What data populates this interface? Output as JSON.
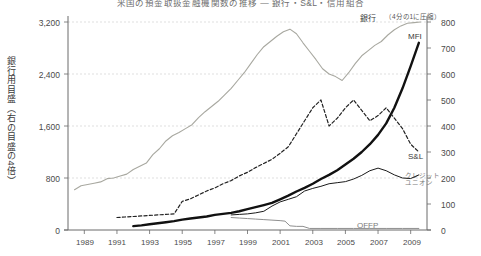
{
  "title": "米国の預金取扱金融機関数の推移 ― 銀行・S&L・信用組合",
  "axes": {
    "left": {
      "label": "銀行用目盛（右の目盛の4倍）",
      "ticks": [
        "3,200",
        "2,400",
        "1,600",
        "800",
        "0"
      ],
      "tick_values": [
        3200,
        2400,
        1600,
        800,
        0
      ],
      "min": 0,
      "max": 3200
    },
    "right": {
      "label": "",
      "ticks": [
        "800",
        "700",
        "600",
        "500",
        "400",
        "300",
        "200",
        "100",
        "0"
      ],
      "tick_values": [
        800,
        700,
        600,
        500,
        400,
        300,
        200,
        100,
        0
      ],
      "min": 0,
      "max": 800
    },
    "x": {
      "ticks": [
        "1989",
        "1991",
        "1993",
        "1995",
        "1997",
        "1999",
        "2001",
        "2003",
        "2005",
        "2007",
        "2009"
      ],
      "min": 1988,
      "max": 2010
    }
  },
  "annotations": {
    "bank": "銀行",
    "bank_note": "（4分の1に圧縮）",
    "mfi": "MFI",
    "snl": "S&L",
    "credit_union_l1": "クレジット",
    "credit_union_l2": "ユニオン",
    "offp": "OFFP"
  },
  "colors": {
    "bank": "#a8a8a0",
    "mfi": "#111111",
    "snl": "#222222",
    "credit_union": "#1a1a1a",
    "offp": "#8f8f8f",
    "grid": "#c9c9c9",
    "axis": "#6a6a6a"
  },
  "chart_data": {
    "type": "line",
    "title": "米国の預金取扱金融機関数の推移 ― 銀行・S&L・信用組合",
    "xlabel": "",
    "ylabel": "銀行用目盛（右の目盛の4倍）",
    "y2label": "",
    "xlim": [
      1988,
      2010
    ],
    "ylim": [
      0,
      3200
    ],
    "y2lim": [
      0,
      800
    ],
    "grid": true,
    "legend": "inline-annotations",
    "note": "銀行系列は左目盛（右目盛の4倍）。その他の系列は右目盛（0-800）。",
    "series": [
      {
        "name": "銀行",
        "axis": "left",
        "style": "solid-gray",
        "color": "#a8a8a0",
        "x": [
          1988.4,
          1988.8,
          1989.2,
          1989.6,
          1990.0,
          1990.4,
          1990.8,
          1991.2,
          1991.6,
          1992.0,
          1992.4,
          1992.8,
          1993.2,
          1993.6,
          1994.0,
          1994.4,
          1994.8,
          1995.2,
          1995.6,
          1996.0,
          1996.4,
          1996.8,
          1997.2,
          1997.6,
          1998.0,
          1998.4,
          1998.8,
          1999.2,
          1999.6,
          2000.0,
          2000.4,
          2000.8,
          2001.2,
          2001.6,
          2002.0,
          2002.4,
          2002.8,
          2003.2,
          2003.6,
          2004.0,
          2004.4,
          2004.8,
          2005.2,
          2005.6,
          2006.0,
          2006.4,
          2006.8,
          2007.2,
          2007.6,
          2008.0,
          2008.4,
          2008.8,
          2009.2,
          2009.6
        ],
        "values": [
          620,
          680,
          700,
          720,
          740,
          790,
          800,
          830,
          860,
          930,
          980,
          1030,
          1160,
          1250,
          1370,
          1450,
          1500,
          1560,
          1620,
          1730,
          1820,
          1900,
          1980,
          2080,
          2180,
          2300,
          2420,
          2560,
          2700,
          2820,
          2900,
          2980,
          3050,
          3090,
          3020,
          2880,
          2750,
          2620,
          2480,
          2400,
          2360,
          2300,
          2420,
          2560,
          2680,
          2760,
          2840,
          2900,
          3000,
          3080,
          3140,
          3180,
          3190,
          3200
        ]
      },
      {
        "name": "MFI",
        "axis": "right",
        "style": "solid-bold-black",
        "color": "#111111",
        "x": [
          1992.0,
          1992.5,
          1993.0,
          1993.5,
          1994.0,
          1994.5,
          1995.0,
          1995.5,
          1996.0,
          1996.5,
          1997.0,
          1997.5,
          1998.0,
          1998.5,
          1999.0,
          1999.5,
          2000.0,
          2000.5,
          2001.0,
          2001.5,
          2002.0,
          2002.5,
          2003.0,
          2003.5,
          2004.0,
          2004.5,
          2005.0,
          2005.5,
          2006.0,
          2006.5,
          2007.0,
          2007.5,
          2008.0,
          2008.5,
          2009.0,
          2009.5
        ],
        "values": [
          15,
          18,
          22,
          26,
          30,
          34,
          40,
          44,
          48,
          52,
          58,
          62,
          66,
          72,
          80,
          88,
          96,
          104,
          118,
          132,
          148,
          162,
          178,
          196,
          212,
          230,
          252,
          274,
          300,
          330,
          366,
          410,
          470,
          545,
          630,
          720
        ]
      },
      {
        "name": "S&L",
        "axis": "right",
        "style": "dashed-black",
        "color": "#222222",
        "x": [
          1991.0,
          1991.5,
          1992.0,
          1992.5,
          1993.0,
          1993.5,
          1994.0,
          1994.5,
          1995.0,
          1995.5,
          1996.0,
          1996.5,
          1997.0,
          1997.5,
          1998.0,
          1998.5,
          1999.0,
          1999.5,
          2000.0,
          2000.5,
          2001.0,
          2001.5,
          2002.0,
          2002.5,
          2003.0,
          2003.5,
          2004.0,
          2004.5,
          2005.0,
          2005.5,
          2006.0,
          2006.5,
          2007.0,
          2007.5,
          2008.0,
          2008.5,
          2009.0,
          2009.5
        ],
        "values": [
          48,
          50,
          52,
          54,
          56,
          58,
          60,
          62,
          110,
          120,
          135,
          150,
          162,
          178,
          190,
          208,
          222,
          240,
          256,
          272,
          295,
          320,
          370,
          420,
          470,
          500,
          400,
          430,
          470,
          500,
          460,
          420,
          440,
          470,
          430,
          390,
          330,
          300
        ]
      },
      {
        "name": "クレジットユニオン",
        "axis": "right",
        "style": "solid-thin-black",
        "color": "#1a1a1a",
        "x": [
          1998.0,
          1998.5,
          1999.0,
          1999.5,
          2000.0,
          2000.5,
          2001.0,
          2001.5,
          2002.0,
          2002.5,
          2003.0,
          2003.5,
          2004.0,
          2004.5,
          2005.0,
          2005.5,
          2006.0,
          2006.5,
          2007.0,
          2007.5,
          2008.0,
          2008.5,
          2009.0,
          2009.5
        ],
        "values": [
          58,
          60,
          62,
          66,
          72,
          92,
          108,
          118,
          128,
          150,
          160,
          168,
          178,
          182,
          186,
          196,
          210,
          228,
          238,
          228,
          212,
          200,
          198,
          212
        ]
      },
      {
        "name": "OFFP",
        "axis": "right",
        "style": "solid-thin-gray",
        "color": "#8f8f8f",
        "x": [
          1998.0,
          1998.5,
          1999.0,
          1999.5,
          2000.0,
          2000.5,
          2001.0,
          2001.3,
          2001.6,
          2002.0,
          2002.4,
          2002.8,
          2003.5,
          2004.5,
          2005.5,
          2006.5,
          2007.5,
          2008.5,
          2009.5
        ],
        "values": [
          48,
          46,
          44,
          42,
          40,
          38,
          36,
          34,
          16,
          14,
          14,
          6,
          6,
          6,
          6,
          6,
          6,
          6,
          6
        ]
      }
    ]
  }
}
